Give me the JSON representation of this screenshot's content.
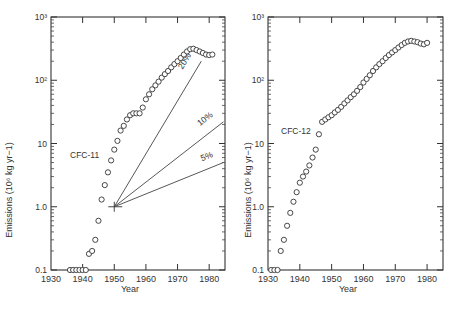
{
  "chart_data": [
    {
      "type": "scatter",
      "title": "",
      "series_label": "CFC-11",
      "xlabel": "Year",
      "ylabel": "Emissions (10⁶ kg yr−1)",
      "yscale": "log",
      "xlim": [
        1930,
        1985
      ],
      "ylim": [
        0.1,
        1000
      ],
      "xticks": [
        "1930",
        "1940",
        "1950",
        "1960",
        "1970",
        "1980"
      ],
      "yticks": [
        "0.1",
        "1.0",
        "10",
        "10²",
        "10³"
      ],
      "grid": false,
      "x": [
        1936,
        1937,
        1938,
        1939,
        1940,
        1941,
        1942,
        1943,
        1944,
        1945,
        1946,
        1947,
        1948,
        1949,
        1950,
        1951,
        1952,
        1953,
        1954,
        1955,
        1956,
        1957,
        1958,
        1959,
        1960,
        1961,
        1962,
        1963,
        1964,
        1965,
        1966,
        1967,
        1968,
        1969,
        1970,
        1971,
        1972,
        1973,
        1974,
        1975,
        1976,
        1977,
        1978,
        1979,
        1980,
        1981
      ],
      "values": [
        0.1,
        0.1,
        0.1,
        0.1,
        0.1,
        0.1,
        0.18,
        0.2,
        0.3,
        0.6,
        1.3,
        2.2,
        3.5,
        5.4,
        8,
        11,
        16,
        19,
        24,
        28,
        30,
        30,
        30,
        37,
        50,
        60,
        72,
        83,
        95,
        110,
        125,
        140,
        160,
        180,
        200,
        225,
        255,
        285,
        310,
        315,
        300,
        285,
        270,
        255,
        250,
        255
      ],
      "growth_lines": {
        "origin": {
          "year": 1950,
          "value": 1.0
        },
        "lines": [
          {
            "label": "20%",
            "end_year": 1977.5,
            "end_value": 200
          },
          {
            "label": "10%",
            "end_year": 1984.5,
            "end_value": 22
          },
          {
            "label": "5%",
            "end_year": 1984.5,
            "end_value": 5
          }
        ]
      }
    },
    {
      "type": "scatter",
      "title": "",
      "series_label": "CFC-12",
      "xlabel": "Year",
      "ylabel": "Emissions (10⁶ kg yr−1)",
      "yscale": "log",
      "xlim": [
        1930,
        1985
      ],
      "ylim": [
        0.1,
        1000
      ],
      "xticks": [
        "1930",
        "1940",
        "1950",
        "1960",
        "1970",
        "1980"
      ],
      "yticks": [
        "0.1",
        "1.0",
        "10",
        "10²",
        "10³"
      ],
      "grid": false,
      "x": [
        1931,
        1932,
        1933,
        1934,
        1935,
        1936,
        1937,
        1938,
        1939,
        1940,
        1941,
        1942,
        1943,
        1944,
        1945,
        1946,
        1947,
        1948,
        1949,
        1950,
        1951,
        1952,
        1953,
        1954,
        1955,
        1956,
        1957,
        1958,
        1959,
        1960,
        1961,
        1962,
        1963,
        1964,
        1965,
        1966,
        1967,
        1968,
        1969,
        1970,
        1971,
        1972,
        1973,
        1974,
        1975,
        1976,
        1977,
        1978,
        1979,
        1980
      ],
      "values": [
        0.1,
        0.1,
        0.1,
        0.2,
        0.3,
        0.5,
        0.8,
        1.2,
        1.7,
        2.4,
        3.0,
        3.6,
        4.5,
        6,
        8,
        14,
        22,
        24,
        26,
        28,
        31,
        34,
        38,
        43,
        48,
        54,
        60,
        68,
        78,
        92,
        105,
        120,
        140,
        160,
        180,
        200,
        225,
        250,
        275,
        300,
        330,
        360,
        390,
        410,
        420,
        410,
        400,
        380,
        370,
        390
      ]
    }
  ],
  "labels": {
    "left_series": "CFC-11",
    "right_series": "CFC-12",
    "xlabel": "Year",
    "ylabel": "Emissions (10⁶ kg yr−1)"
  }
}
